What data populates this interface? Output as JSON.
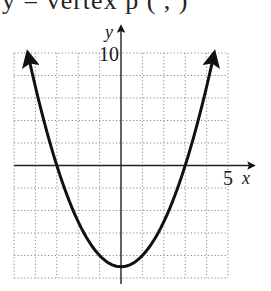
{
  "header": {
    "clipped_text": "y =  vertex p (   ,   )"
  },
  "chart_data": {
    "type": "line",
    "title": "",
    "function": "y = x^2 - 9",
    "xlabel": "x",
    "ylabel": "y",
    "xlim": [
      -5,
      5
    ],
    "ylim": [
      -10,
      10
    ],
    "x_tick_labels": [
      {
        "value": 5,
        "label": "5"
      }
    ],
    "y_tick_labels": [
      {
        "value": 10,
        "label": "10"
      }
    ],
    "grid": true,
    "grid_style": "dotted",
    "x_grid_step": 1,
    "y_grid_step": 2,
    "series": [
      {
        "name": "parabola",
        "x": [
          -4.36,
          -4,
          -3,
          -2,
          -1,
          0,
          1,
          2,
          3,
          4,
          4.36
        ],
        "values": [
          10,
          7,
          0,
          -5,
          -8,
          -9,
          -8,
          -5,
          0,
          7,
          10
        ]
      }
    ],
    "annotations": [
      "vertex at (0, -9)",
      "x-intercepts at (-3, 0) and (3, 0)",
      "arrows at both ends of curve"
    ],
    "colors": {
      "curve": "#111111",
      "grid": "#888888",
      "axes": "#222222"
    }
  }
}
